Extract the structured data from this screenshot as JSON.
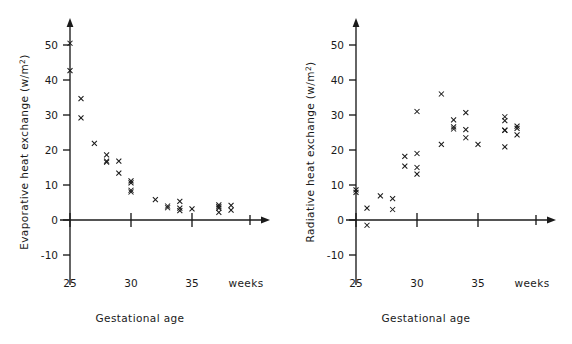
{
  "figure": {
    "background": "#ffffff",
    "ink": "#1a1a1a",
    "marker_symbol": "x"
  },
  "chart_data": [
    {
      "type": "scatter",
      "panel": "left",
      "title": "",
      "xlabel": "Gestational age",
      "ylabel": "Evaporative heat exchange (w/m2)",
      "ylabel_main": "Evaporative heat exchange (w/m",
      "ylabel_sup": "2",
      "ylabel_tail": ")",
      "x_unit_note": "weeks",
      "xlim": [
        24.0,
        39.0
      ],
      "ylim": [
        -12,
        55
      ],
      "xticks": [
        25,
        30,
        35
      ],
      "xticklabels": [
        "25",
        "30",
        "35"
      ],
      "yticks": [
        -10,
        0,
        10,
        20,
        30,
        40,
        50
      ],
      "yticklabels": [
        "-10",
        "0",
        "10",
        "20",
        "30",
        "40",
        "50"
      ],
      "grid": false,
      "legend": false,
      "points": [
        {
          "x": 25.0,
          "y": 50.5
        },
        {
          "x": 25.0,
          "y": 42.7
        },
        {
          "x": 25.9,
          "y": 34.7
        },
        {
          "x": 25.9,
          "y": 29.2
        },
        {
          "x": 27.0,
          "y": 21.9
        },
        {
          "x": 28.0,
          "y": 18.6
        },
        {
          "x": 28.0,
          "y": 16.8
        },
        {
          "x": 28.0,
          "y": 16.5
        },
        {
          "x": 29.0,
          "y": 16.8
        },
        {
          "x": 29.0,
          "y": 13.4
        },
        {
          "x": 30.0,
          "y": 11.2
        },
        {
          "x": 30.0,
          "y": 10.6
        },
        {
          "x": 30.0,
          "y": 8.5
        },
        {
          "x": 30.0,
          "y": 8.0
        },
        {
          "x": 32.0,
          "y": 5.8
        },
        {
          "x": 33.0,
          "y": 4.0
        },
        {
          "x": 33.0,
          "y": 3.5
        },
        {
          "x": 34.0,
          "y": 5.3
        },
        {
          "x": 34.0,
          "y": 3.4
        },
        {
          "x": 34.0,
          "y": 2.7
        },
        {
          "x": 35.0,
          "y": 3.2
        },
        {
          "x": 37.2,
          "y": 4.3
        },
        {
          "x": 37.2,
          "y": 3.8
        },
        {
          "x": 37.2,
          "y": 3.4
        },
        {
          "x": 37.2,
          "y": 2.2
        },
        {
          "x": 38.2,
          "y": 4.2
        },
        {
          "x": 38.2,
          "y": 2.8
        }
      ]
    },
    {
      "type": "scatter",
      "panel": "right",
      "title": "",
      "xlabel": "Gestational age",
      "ylabel": "Radiative heat exchange (w/m2)",
      "ylabel_main": "Radiative heat exchange (w/m",
      "ylabel_sup": "2",
      "ylabel_tail": ")",
      "x_unit_note": "weeks",
      "xlim": [
        24.0,
        39.0
      ],
      "ylim": [
        -12,
        55
      ],
      "xticks": [
        25,
        30,
        35
      ],
      "xticklabels": [
        "25",
        "30",
        "35"
      ],
      "yticks": [
        -10,
        0,
        10,
        20,
        30,
        40,
        50
      ],
      "yticklabels": [
        "-10",
        "0",
        "10",
        "20",
        "30",
        "40",
        "50"
      ],
      "grid": false,
      "legend": false,
      "points": [
        {
          "x": 25.0,
          "y": 8.6
        },
        {
          "x": 25.0,
          "y": 7.9
        },
        {
          "x": 25.9,
          "y": 3.4
        },
        {
          "x": 25.9,
          "y": -1.5
        },
        {
          "x": 27.0,
          "y": 6.9
        },
        {
          "x": 28.0,
          "y": 6.1
        },
        {
          "x": 28.0,
          "y": 3.0
        },
        {
          "x": 29.0,
          "y": 18.2
        },
        {
          "x": 29.0,
          "y": 15.4
        },
        {
          "x": 30.0,
          "y": 31.0
        },
        {
          "x": 30.0,
          "y": 19.0
        },
        {
          "x": 30.0,
          "y": 15.0
        },
        {
          "x": 30.0,
          "y": 13.1
        },
        {
          "x": 32.0,
          "y": 36.0
        },
        {
          "x": 32.0,
          "y": 21.6
        },
        {
          "x": 33.0,
          "y": 28.6
        },
        {
          "x": 33.0,
          "y": 26.6
        },
        {
          "x": 33.0,
          "y": 26.0
        },
        {
          "x": 34.0,
          "y": 30.7
        },
        {
          "x": 34.0,
          "y": 25.8
        },
        {
          "x": 34.0,
          "y": 23.5
        },
        {
          "x": 35.0,
          "y": 21.6
        },
        {
          "x": 37.2,
          "y": 29.5
        },
        {
          "x": 37.2,
          "y": 28.4
        },
        {
          "x": 37.2,
          "y": 25.7
        },
        {
          "x": 37.2,
          "y": 25.6
        },
        {
          "x": 37.2,
          "y": 20.9
        },
        {
          "x": 38.2,
          "y": 26.8
        },
        {
          "x": 38.2,
          "y": 26.2
        },
        {
          "x": 38.2,
          "y": 24.3
        }
      ]
    }
  ]
}
